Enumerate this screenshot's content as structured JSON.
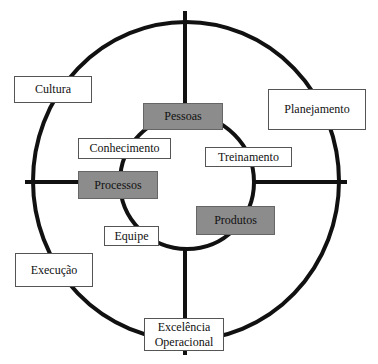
{
  "diagram": {
    "type": "concentric-circles-with-cross",
    "colors": {
      "line": "#111111",
      "box_fill": "#ffffff",
      "box_fill_highlight": "#8c8c8c",
      "box_border": "#555555"
    },
    "outer_ring": {
      "labels": {
        "top_left": "Cultura",
        "top_right": "Planejamento",
        "bottom_left": "Execução",
        "bottom": "Excelência Operacional"
      }
    },
    "inner_ring": {
      "highlighted": {
        "top": "Pessoas",
        "left": "Processos",
        "right": "Produtos"
      },
      "plain": {
        "top_left": "Conhecimento",
        "top_right": "Treinamento",
        "bottom_left": "Equipe"
      }
    }
  }
}
